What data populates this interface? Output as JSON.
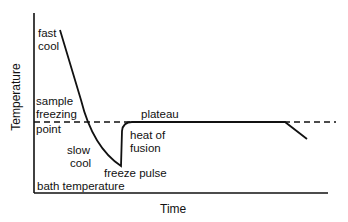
{
  "diagram": {
    "axes": {
      "ylabel": "Temperature",
      "xlabel": "Time"
    },
    "labels": {
      "fast_cool_1": "fast",
      "fast_cool_2": "cool",
      "sample_1": "sample",
      "sample_2": "freezing",
      "sample_3": "point",
      "slow_cool_1": "slow",
      "slow_cool_2": "cool",
      "freeze_pulse": "freeze pulse",
      "heat_fusion_1": "heat of",
      "heat_fusion_2": "fusion",
      "plateau": "plateau",
      "bath_temperature": "bath temperature"
    },
    "colors": {
      "line": "#111111",
      "background": "#ffffff"
    }
  }
}
